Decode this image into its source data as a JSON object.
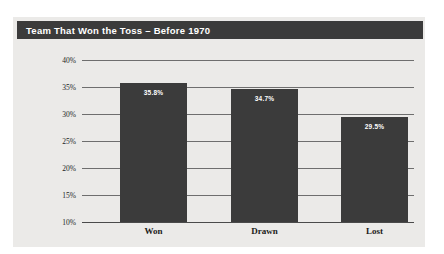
{
  "panel": {
    "background_color": "#ebeae8",
    "title_bar_color": "#3b3b3b",
    "title_text_color": "#ffffff"
  },
  "chart_data": {
    "type": "bar",
    "title": "Team That Won the Toss – Before 1970",
    "xlabel": "",
    "ylabel": "",
    "categories": [
      "Won",
      "Drawn",
      "Lost"
    ],
    "values": [
      35.8,
      34.7,
      29.5
    ],
    "value_labels": [
      "35.8%",
      "34.7%",
      "29.5%"
    ],
    "ylim": [
      10,
      40
    ],
    "ytick_values": [
      40,
      35,
      30,
      25,
      20,
      15,
      10
    ],
    "ytick_labels": [
      "40%",
      "35%",
      "30%",
      "25%",
      "20%",
      "15%",
      "10%"
    ],
    "grid": true,
    "legend": false,
    "bar_color": "#3b3b3b",
    "value_label_color": "#ffffff",
    "gridline_color": "#6e6e6e"
  }
}
